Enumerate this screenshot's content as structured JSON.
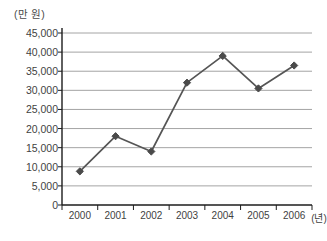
{
  "chart_data": {
    "type": "line",
    "title": "",
    "xlabel": "(년)",
    "ylabel": "(만 원)",
    "categories": [
      "2000",
      "2001",
      "2002",
      "2003",
      "2004",
      "2005",
      "2006"
    ],
    "values": [
      8800,
      18000,
      14000,
      32000,
      39000,
      30500,
      36500
    ],
    "series": [
      {
        "name": "",
        "values": [
          8800,
          18000,
          14000,
          32000,
          39000,
          30500,
          36500
        ]
      }
    ],
    "ylim": [
      0,
      45000
    ],
    "ytick_step": 5000,
    "ytick_labels": [
      "45,000",
      "40,000",
      "35,000",
      "30,000",
      "25,000",
      "20,000",
      "15,000",
      "10,000",
      "5,000",
      "0"
    ],
    "ytick_values": [
      45000,
      40000,
      35000,
      30000,
      25000,
      20000,
      15000,
      10000,
      5000,
      0
    ],
    "xtick_labels": [
      "2000",
      "2001",
      "2002",
      "2003",
      "2004",
      "2005",
      "2006"
    ],
    "grid": "horizontal",
    "legend": "none",
    "marker": "diamond",
    "colors": {
      "line": "#555555",
      "marker": "#4a4a4a",
      "gridline": "#9a9a9a",
      "axis": "#1c1c1c",
      "text": "#3f3f3f",
      "background": "#ffffff"
    }
  },
  "axis": {
    "y_unit_label": "(만 원)",
    "x_unit_label": "(년)"
  }
}
